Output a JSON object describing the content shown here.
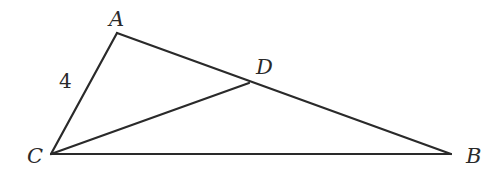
{
  "diagram": {
    "type": "triangle",
    "points": {
      "A": {
        "label": "A",
        "x": 117,
        "y": 33
      },
      "B": {
        "label": "B",
        "x": 451,
        "y": 154
      },
      "C": {
        "label": "C",
        "x": 51,
        "y": 154
      },
      "D": {
        "label": "D",
        "x": 249,
        "y": 83
      }
    },
    "segments": [
      [
        "A",
        "C"
      ],
      [
        "A",
        "B"
      ],
      [
        "C",
        "B"
      ],
      [
        "C",
        "D"
      ]
    ],
    "annotations": {
      "AC_length": "4"
    },
    "colors": {
      "stroke": "#2a2a2a",
      "background": "#ffffff"
    }
  }
}
